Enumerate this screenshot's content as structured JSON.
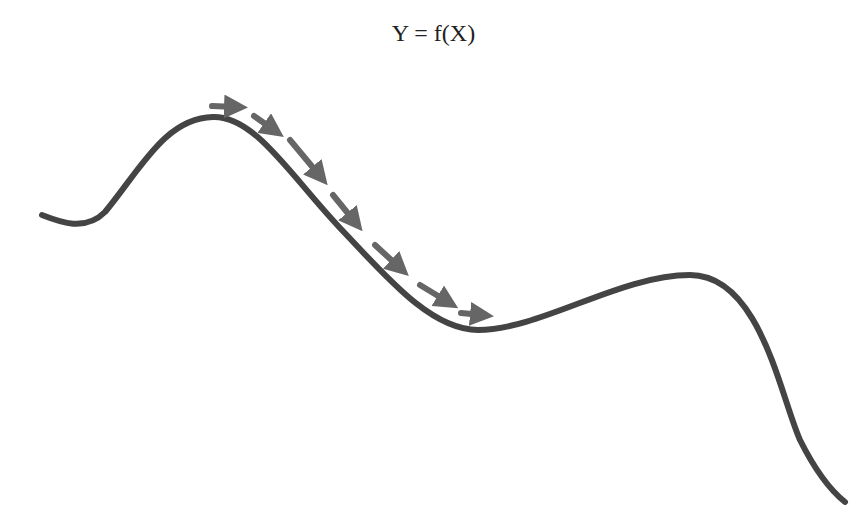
{
  "figure": {
    "title": "Y = f(X)",
    "curve_color": "#444444",
    "arrow_color": "#666666"
  },
  "icons": {
    "arrows": "gradient-descent-step-arrows"
  }
}
